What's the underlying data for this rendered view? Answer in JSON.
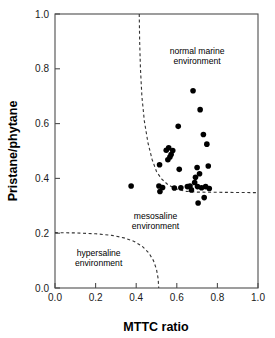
{
  "chart_data": {
    "type": "scatter",
    "title": "",
    "xlabel": "MTTC ratio",
    "ylabel": "Pristane/phytane",
    "xlim": [
      0.0,
      1.0
    ],
    "ylim": [
      0.0,
      1.0
    ],
    "xticks": [
      "0.0",
      "0.2",
      "0.4",
      "0.6",
      "0.8",
      "1.0"
    ],
    "xtick_values": [
      0.0,
      0.2,
      0.4,
      0.6,
      0.8,
      1.0
    ],
    "yticks": [
      "0.0",
      "0.2",
      "0.4",
      "0.6",
      "0.8",
      "1.0"
    ],
    "ytick_values": [
      0.0,
      0.2,
      0.4,
      0.6,
      0.8,
      1.0
    ],
    "grid": false,
    "legend": "none",
    "marker_color": "#000000",
    "marker_shape": "circle",
    "marker_size": 5.6,
    "series": [
      {
        "name": "samples",
        "points": [
          [
            0.375,
            0.372
          ],
          [
            0.515,
            0.45
          ],
          [
            0.512,
            0.372
          ],
          [
            0.517,
            0.352
          ],
          [
            0.53,
            0.367
          ],
          [
            0.548,
            0.503
          ],
          [
            0.56,
            0.512
          ],
          [
            0.556,
            0.468
          ],
          [
            0.566,
            0.478
          ],
          [
            0.572,
            0.487
          ],
          [
            0.58,
            0.502
          ],
          [
            0.588,
            0.365
          ],
          [
            0.607,
            0.59
          ],
          [
            0.612,
            0.433
          ],
          [
            0.62,
            0.366
          ],
          [
            0.652,
            0.37
          ],
          [
            0.665,
            0.372
          ],
          [
            0.672,
            0.358
          ],
          [
            0.68,
            0.72
          ],
          [
            0.688,
            0.385
          ],
          [
            0.692,
            0.404
          ],
          [
            0.7,
            0.44
          ],
          [
            0.702,
            0.37
          ],
          [
            0.705,
            0.31
          ],
          [
            0.712,
            0.417
          ],
          [
            0.715,
            0.651
          ],
          [
            0.722,
            0.366
          ],
          [
            0.731,
            0.56
          ],
          [
            0.735,
            0.33
          ],
          [
            0.742,
            0.37
          ],
          [
            0.748,
            0.525
          ],
          [
            0.755,
            0.445
          ],
          [
            0.76,
            0.363
          ]
        ]
      }
    ],
    "boundaries": [
      {
        "name": "mesosaline-normal-marine-boundary",
        "style": "dashed",
        "color": "#333333",
        "path": [
          [
            0.415,
            1.0
          ],
          [
            0.417,
            0.9
          ],
          [
            0.421,
            0.8
          ],
          [
            0.428,
            0.7
          ],
          [
            0.44,
            0.61
          ],
          [
            0.458,
            0.53
          ],
          [
            0.478,
            0.47
          ],
          [
            0.5,
            0.425
          ],
          [
            0.525,
            0.398
          ],
          [
            0.555,
            0.378
          ],
          [
            0.59,
            0.363
          ],
          [
            0.64,
            0.353
          ],
          [
            0.7,
            0.35
          ],
          [
            1.0,
            0.348
          ]
        ]
      },
      {
        "name": "hypersaline-boundary",
        "style": "dashed",
        "color": "#333333",
        "path": [
          [
            0.0,
            0.202
          ],
          [
            0.1,
            0.201
          ],
          [
            0.2,
            0.198
          ],
          [
            0.28,
            0.192
          ],
          [
            0.34,
            0.183
          ],
          [
            0.39,
            0.17
          ],
          [
            0.43,
            0.152
          ],
          [
            0.462,
            0.128
          ],
          [
            0.485,
            0.1
          ],
          [
            0.5,
            0.068
          ],
          [
            0.508,
            0.035
          ],
          [
            0.511,
            0.0
          ]
        ]
      }
    ],
    "annotations": [
      {
        "name": "normal-marine-label",
        "lines": [
          "normal marine",
          "environment"
        ],
        "x": 0.7,
        "y": 0.855
      },
      {
        "name": "mesosaline-label",
        "lines": [
          "mesosaline",
          "environment"
        ],
        "x": 0.495,
        "y": 0.253
      },
      {
        "name": "hypersaline-label",
        "lines": [
          "hypersaline",
          "environment"
        ],
        "x": 0.215,
        "y": 0.118
      }
    ]
  },
  "axes": {
    "x_title": "MTTC ratio",
    "y_title": "Pristane/phytane"
  }
}
